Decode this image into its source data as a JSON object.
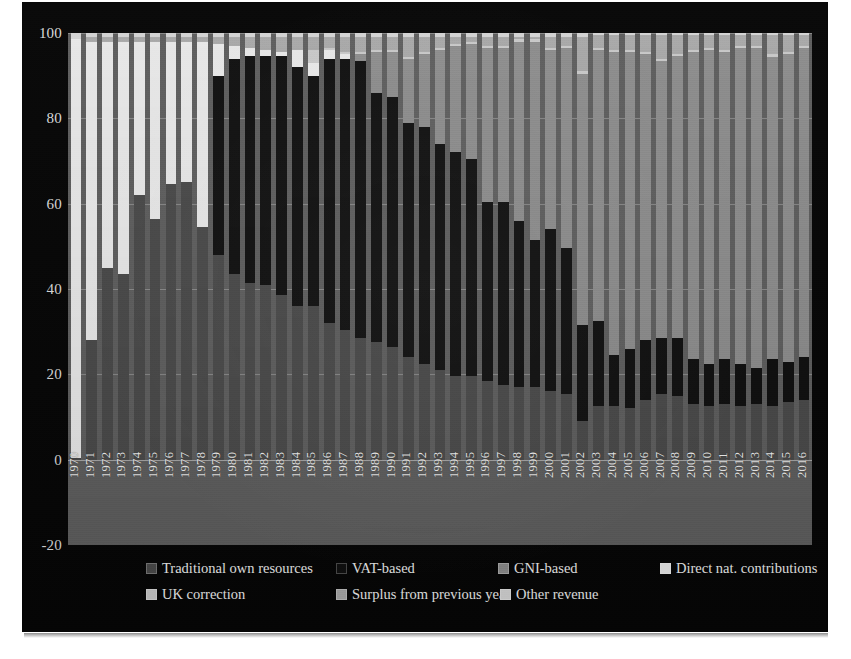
{
  "chart_data": {
    "type": "bar",
    "stacked": true,
    "title": "",
    "subtitle": "",
    "xlabel": "",
    "ylabel": "",
    "ylim": [
      -20,
      100
    ],
    "yticks": [
      -20,
      0,
      20,
      40,
      60,
      80,
      100
    ],
    "ytick_labels": [
      "-20",
      "0",
      "20",
      "40",
      "60",
      "80",
      "100"
    ],
    "grid": true,
    "legend_position": "bottom",
    "categories": [
      "1970",
      "1971",
      "1972",
      "1973",
      "1974",
      "1975",
      "1976",
      "1977",
      "1978",
      "1979",
      "1980",
      "1981",
      "1982",
      "1983",
      "1984",
      "1985",
      "1986",
      "1987",
      "1988",
      "1989",
      "1990",
      "1991",
      "1992",
      "1993",
      "1994",
      "1995",
      "1996",
      "1997",
      "1998",
      "1999",
      "2000",
      "2001",
      "2002",
      "2003",
      "2004",
      "2005",
      "2006",
      "2007",
      "2008",
      "2009",
      "2010",
      "2011",
      "2012",
      "2013",
      "2014",
      "2015",
      "2016"
    ],
    "series": [
      {
        "name": "Traditional own resources",
        "color": "#4a4a4a",
        "values": [
          0.5,
          28.0,
          45.0,
          43.5,
          62.0,
          56.5,
          64.5,
          65.0,
          54.5,
          48.0,
          43.5,
          41.5,
          41.0,
          38.5,
          36.0,
          36.0,
          32.0,
          30.5,
          28.5,
          27.5,
          26.5,
          24.0,
          22.5,
          21.0,
          19.5,
          19.5,
          18.5,
          17.5,
          17.0,
          17.0,
          16.0,
          15.5,
          9.0,
          12.5,
          12.5,
          12.0,
          14.0,
          15.5,
          15.0,
          13.0,
          12.5,
          13.0,
          12.5,
          13.0,
          12.5,
          13.5,
          14.0
        ]
      },
      {
        "name": "VAT-based",
        "color": "#101010",
        "values": [
          0.0,
          0.0,
          0.0,
          0.0,
          0.0,
          0.0,
          0.0,
          0.0,
          0.0,
          42.0,
          50.5,
          53.0,
          53.5,
          56.0,
          56.0,
          54.0,
          62.0,
          63.5,
          65.0,
          58.5,
          58.5,
          55.0,
          55.5,
          53.0,
          52.5,
          51.0,
          42.0,
          43.0,
          39.0,
          34.5,
          38.0,
          34.0,
          22.5,
          20.0,
          12.0,
          14.0,
          14.0,
          13.0,
          13.5,
          10.5,
          10.0,
          10.5,
          10.0,
          8.5,
          11.0,
          9.5,
          10.0
        ]
      },
      {
        "name": "GNI-based",
        "color": "#8d8d8d",
        "values": [
          0.0,
          0.0,
          0.0,
          0.0,
          0.0,
          0.0,
          0.0,
          0.0,
          0.0,
          0.0,
          0.0,
          0.0,
          0.0,
          0.0,
          0.0,
          0.0,
          0.0,
          0.0,
          1.5,
          9.5,
          10.5,
          15.0,
          17.0,
          22.0,
          25.0,
          27.0,
          36.0,
          36.0,
          42.0,
          46.5,
          42.0,
          47.0,
          59.0,
          63.5,
          71.0,
          69.5,
          67.0,
          65.0,
          66.0,
          72.0,
          73.5,
          72.0,
          74.0,
          75.0,
          71.0,
          72.0,
          72.5
        ]
      },
      {
        "name": "Direct nat. contributions",
        "color": "#e9e9e9",
        "values": [
          98.0,
          70.0,
          53.0,
          54.5,
          36.0,
          41.5,
          33.5,
          33.0,
          43.5,
          7.5,
          3.0,
          2.0,
          1.5,
          1.0,
          4.0,
          3.0,
          2.0,
          1.0,
          0.0,
          0.0,
          0.0,
          0.0,
          0.0,
          0.0,
          0.0,
          0.0,
          0.0,
          0.0,
          0.0,
          0.0,
          0.0,
          0.0,
          0.0,
          0.0,
          0.0,
          0.0,
          0.0,
          0.0,
          0.0,
          0.0,
          0.0,
          0.0,
          0.0,
          0.0,
          0.0,
          0.0,
          0.0
        ]
      },
      {
        "name": "UK correction",
        "color": "#c9c9c9",
        "values": [
          0.0,
          0.0,
          0.0,
          0.0,
          0.0,
          0.0,
          0.0,
          0.0,
          0.0,
          0.0,
          0.0,
          0.0,
          0.0,
          0.0,
          0.0,
          3.0,
          0.5,
          0.5,
          0.5,
          0.5,
          0.5,
          0.5,
          0.5,
          0.5,
          0.5,
          0.5,
          0.5,
          0.5,
          0.5,
          0.5,
          0.5,
          0.5,
          0.5,
          0.5,
          0.5,
          0.5,
          0.5,
          0.5,
          0.5,
          0.5,
          0.5,
          0.5,
          0.5,
          0.5,
          0.5,
          0.5,
          0.5
        ]
      },
      {
        "name": "Surplus from previous year",
        "color": "#a9a9a9",
        "values": [
          0.0,
          1.0,
          1.0,
          1.0,
          1.0,
          1.0,
          1.0,
          1.0,
          1.0,
          1.5,
          2.0,
          2.5,
          3.0,
          3.5,
          3.0,
          3.0,
          2.5,
          3.5,
          3.5,
          3.0,
          3.0,
          4.5,
          3.5,
          2.5,
          1.5,
          1.0,
          2.0,
          2.0,
          0.5,
          0.5,
          2.5,
          2.0,
          8.0,
          3.0,
          3.5,
          3.5,
          4.0,
          5.5,
          4.5,
          3.5,
          3.0,
          3.5,
          2.5,
          2.5,
          4.5,
          4.0,
          2.5
        ]
      },
      {
        "name": "Other revenue",
        "color": "#d4d4d4",
        "values": [
          1.5,
          1.0,
          1.0,
          1.0,
          1.0,
          1.0,
          1.0,
          1.0,
          1.0,
          1.0,
          1.0,
          1.0,
          1.0,
          1.0,
          1.0,
          1.0,
          1.0,
          1.0,
          1.0,
          1.0,
          1.0,
          1.0,
          1.0,
          1.0,
          1.0,
          1.0,
          1.0,
          1.0,
          1.0,
          1.0,
          1.0,
          1.0,
          1.0,
          0.5,
          0.5,
          0.5,
          0.5,
          0.5,
          0.5,
          0.5,
          0.5,
          0.5,
          0.5,
          1.0,
          0.5,
          0.5,
          0.5
        ]
      }
    ]
  },
  "legend": {
    "rows": [
      [
        {
          "label": "Traditional own resources",
          "color": "#4a4a4a",
          "left": 78
        },
        {
          "label": "VAT-based",
          "color": "#101010",
          "left": 268
        },
        {
          "label": "GNI-based",
          "color": "#8d8d8d",
          "left": 430
        },
        {
          "label": "Direct nat. contributions",
          "color": "#e9e9e9",
          "left": 592
        }
      ],
      [
        {
          "label": "UK correction",
          "color": "#c9c9c9",
          "left": 78
        },
        {
          "label": "Surplus from previous year",
          "color": "#a9a9a9",
          "left": 268
        },
        {
          "label": "Other revenue",
          "color": "#d4d4d4",
          "left": 432
        }
      ]
    ]
  },
  "colors": {
    "panel_background": "#060606",
    "plot_background": "#5e5e5e",
    "axis_text": "#dcdcdc",
    "gridline": "#d7d7d7"
  }
}
